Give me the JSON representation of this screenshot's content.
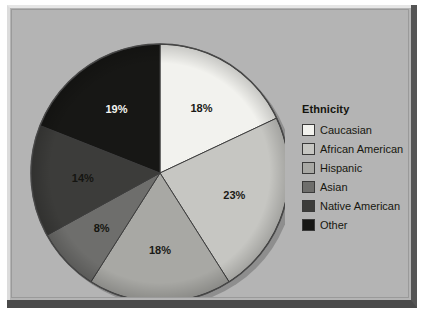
{
  "figure": {
    "panel_background": "#b4b4b4"
  },
  "legend": {
    "title": "Ethnicity",
    "items": [
      {
        "label": "Caucasian",
        "color": "#f2f2ee"
      },
      {
        "label": "African American",
        "color": "#c6c6c2"
      },
      {
        "label": "Hispanic",
        "color": "#a8a8a4"
      },
      {
        "label": "Asian",
        "color": "#6e6e6c"
      },
      {
        "label": "Native American",
        "color": "#3c3c3a"
      },
      {
        "label": "Other",
        "color": "#171715"
      }
    ]
  },
  "chart_data": {
    "type": "pie",
    "title": "",
    "legend_title": "Ethnicity",
    "legend_position": "right",
    "start_angle_deg": 0,
    "direction": "clockwise",
    "categories": [
      "Caucasian",
      "African American",
      "Hispanic",
      "Asian",
      "Native American",
      "Other"
    ],
    "values": [
      18,
      23,
      18,
      8,
      14,
      19
    ],
    "labels": [
      "18%",
      "23%",
      "18%",
      "8%",
      "14%",
      "19%"
    ],
    "units": "percent",
    "colors": [
      "#f2f2ee",
      "#c6c6c2",
      "#a8a8a4",
      "#6e6e6c",
      "#3c3c3a",
      "#171715"
    ],
    "label_colors": [
      "#1a1a16",
      "#1a1a16",
      "#1a1a16",
      "#15150f",
      "#151511",
      "#f4f4f0"
    ],
    "total": 100
  }
}
